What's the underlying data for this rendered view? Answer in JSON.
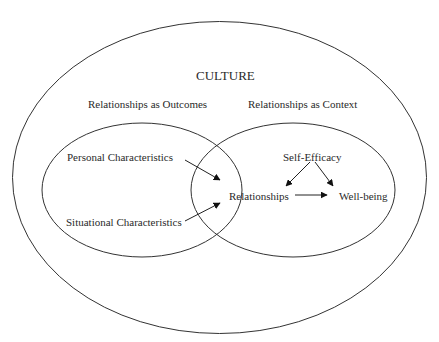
{
  "diagram": {
    "title": "CULTURE",
    "regions": {
      "left_header": "Relationships as Outcomes",
      "right_header": "Relationships as Context"
    },
    "nodes": {
      "personal": "Personal Characteristics",
      "situational": "Situational Characteristics",
      "self_efficacy": "Self-Efficacy",
      "relationships": "Relationships",
      "well_being": "Well-being"
    },
    "edges": [
      {
        "from": "Personal Characteristics",
        "to": "Relationships"
      },
      {
        "from": "Situational Characteristics",
        "to": "Relationships"
      },
      {
        "from": "Self-Efficacy",
        "to": "Relationships"
      },
      {
        "from": "Self-Efficacy",
        "to": "Well-being"
      },
      {
        "from": "Relationships",
        "to": "Well-being"
      }
    ]
  }
}
